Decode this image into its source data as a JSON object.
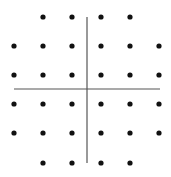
{
  "figure": {
    "background": "#ffffff",
    "axis_color": "#555555",
    "dot_color": "#111111",
    "dot_radius": 2.6
  },
  "axes": {
    "horizontal": {
      "x1": 14,
      "x2": 160,
      "y": 89
    },
    "vertical": {
      "x": 87,
      "y1": 17,
      "y2": 163
    }
  },
  "grid": {
    "columns_x": [
      14,
      43,
      72,
      101,
      130,
      159
    ],
    "rows_y": [
      17,
      46,
      75,
      104,
      133,
      163
    ],
    "rows": [
      {
        "row": 0,
        "cols": [
          1,
          2,
          3,
          4
        ]
      },
      {
        "row": 1,
        "cols": [
          0,
          1,
          2,
          3,
          4,
          5
        ]
      },
      {
        "row": 2,
        "cols": [
          0,
          1,
          2,
          3,
          4,
          5
        ]
      },
      {
        "row": 3,
        "cols": [
          0,
          1,
          2,
          3,
          4,
          5
        ]
      },
      {
        "row": 4,
        "cols": [
          0,
          1,
          2,
          3,
          4,
          5
        ]
      },
      {
        "row": 5,
        "cols": [
          1,
          2,
          3,
          4
        ]
      }
    ]
  },
  "chart_data": {
    "type": "scatter",
    "title": "",
    "xlabel": "",
    "ylabel": "",
    "x": [
      -2,
      -1,
      1,
      2,
      -3,
      -2,
      -1,
      1,
      2,
      3,
      -3,
      -2,
      -1,
      1,
      2,
      3,
      -3,
      -2,
      -1,
      1,
      2,
      3,
      -3,
      -2,
      -1,
      1,
      2,
      3,
      -2,
      -1,
      1,
      2
    ],
    "y": [
      3,
      3,
      3,
      3,
      2,
      2,
      2,
      2,
      2,
      2,
      1,
      1,
      1,
      1,
      1,
      1,
      -1,
      -1,
      -1,
      -1,
      -1,
      -1,
      -2,
      -2,
      -2,
      -2,
      -2,
      -2,
      -3,
      -3,
      -3,
      -3
    ],
    "xlim": [
      -3,
      3
    ],
    "ylim": [
      -3,
      3
    ],
    "grid": false,
    "legend": null
  }
}
